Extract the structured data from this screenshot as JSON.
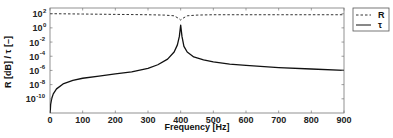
{
  "chart_data": {
    "type": "line",
    "title": "",
    "xlabel": "Frequency [Hz]",
    "ylabel": "R [dB] / τ [–]",
    "xlim": [
      0,
      900
    ],
    "yscale": "log",
    "ylim_exp": [
      -12,
      2.8
    ],
    "x_ticks": [
      0,
      100,
      200,
      300,
      400,
      500,
      600,
      700,
      800,
      900
    ],
    "y_ticks": [
      {
        "base": "10",
        "exp": "2",
        "value_exp": 2
      },
      {
        "base": "10",
        "exp": "0",
        "value_exp": 0
      },
      {
        "base": "10",
        "exp": "-2",
        "value_exp": -2
      },
      {
        "base": "10",
        "exp": "-4",
        "value_exp": -4
      },
      {
        "base": "10",
        "exp": "-6",
        "value_exp": -6
      },
      {
        "base": "10",
        "exp": "-8",
        "value_exp": -8
      },
      {
        "base": "10",
        "exp": "-10",
        "value_exp": -10
      }
    ],
    "grid": false,
    "legend_position": "outside-right-top",
    "series": [
      {
        "name": "R",
        "style": "dashed",
        "color": "#333333",
        "x": [
          0,
          100,
          200,
          300,
          350,
          380,
          395,
          400,
          405,
          420,
          450,
          500,
          600,
          700,
          800,
          900
        ],
        "log10_y": [
          2.0,
          1.95,
          1.9,
          1.85,
          1.8,
          1.7,
          1.3,
          1.1,
          1.3,
          1.7,
          1.8,
          1.85,
          1.85,
          1.85,
          1.85,
          1.85
        ]
      },
      {
        "name": "τ",
        "style": "solid",
        "color": "#111111",
        "x": [
          0.5,
          2,
          5,
          10,
          20,
          40,
          70,
          100,
          150,
          200,
          250,
          300,
          330,
          360,
          380,
          390,
          396,
          400,
          404,
          410,
          420,
          440,
          470,
          500,
          550,
          600,
          700,
          800,
          900
        ],
        "log10_y": [
          -12,
          -10.8,
          -10,
          -9.3,
          -8.6,
          -7.9,
          -7.4,
          -7.1,
          -6.8,
          -6.5,
          -6.2,
          -5.7,
          -5.2,
          -4.4,
          -3.4,
          -2.4,
          -1.2,
          0.4,
          -1.2,
          -2.6,
          -3.4,
          -4.1,
          -4.5,
          -4.8,
          -5.1,
          -5.3,
          -5.6,
          -5.8,
          -6.0
        ]
      }
    ]
  }
}
